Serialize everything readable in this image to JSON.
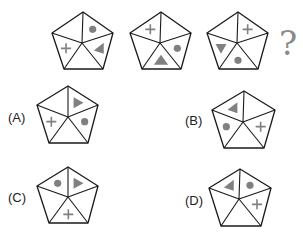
{
  "question_mark": "?",
  "colors": {
    "stroke": "#1a1a1a",
    "symbol": "#808080"
  },
  "sequence": [
    {
      "id": "seq-1",
      "top": [
        83,
        12
      ],
      "right": [
        113,
        33
      ],
      "br": [
        103,
        69
      ],
      "bl": [
        64,
        69
      ],
      "left": [
        52,
        33
      ],
      "center": [
        82,
        43
      ],
      "symbols": {
        "0": "dot",
        "1": "triangle-left",
        "3": "plus"
      }
    },
    {
      "id": "seq-2",
      "top": [
        161,
        12
      ],
      "right": [
        191,
        33
      ],
      "br": [
        181,
        69
      ],
      "bl": [
        142,
        69
      ],
      "left": [
        130,
        33
      ],
      "center": [
        160,
        43
      ],
      "symbols": {
        "1": "dot",
        "2": "triangle-up",
        "4": "plus"
      }
    },
    {
      "id": "seq-3",
      "top": [
        238,
        12
      ],
      "right": [
        268,
        33
      ],
      "br": [
        258,
        69
      ],
      "bl": [
        219,
        69
      ],
      "left": [
        207,
        33
      ],
      "center": [
        237,
        43
      ],
      "symbols": {
        "0": "plus",
        "2": "dot",
        "3": "triangle-down"
      }
    }
  ],
  "options": [
    {
      "label": "(A)",
      "label_pos": [
        8,
        110
      ],
      "top": [
        68,
        86
      ],
      "right": [
        98,
        105
      ],
      "br": [
        88,
        143
      ],
      "bl": [
        49,
        143
      ],
      "left": [
        37,
        105
      ],
      "center": [
        68,
        117
      ],
      "symbols": {
        "0": "triangle-right",
        "1": "dot",
        "3": "plus"
      }
    },
    {
      "label": "(B)",
      "label_pos": [
        185,
        113
      ],
      "top": [
        244,
        91
      ],
      "right": [
        275,
        110
      ],
      "br": [
        264,
        148
      ],
      "bl": [
        224,
        148
      ],
      "left": [
        212,
        110
      ],
      "center": [
        243,
        122
      ],
      "symbols": {
        "1": "plus",
        "3": "dot",
        "4": "triangle-left"
      }
    },
    {
      "label": "(C)",
      "label_pos": [
        8,
        190
      ],
      "top": [
        68,
        167
      ],
      "right": [
        98,
        186
      ],
      "br": [
        88,
        223
      ],
      "bl": [
        49,
        223
      ],
      "left": [
        37,
        186
      ],
      "center": [
        68,
        197
      ],
      "symbols": {
        "0": "triangle-right",
        "2": "plus",
        "4": "dot"
      }
    },
    {
      "label": "(D)",
      "label_pos": [
        185,
        193
      ],
      "top": [
        240,
        169
      ],
      "right": [
        271,
        188
      ],
      "br": [
        261,
        226
      ],
      "bl": [
        221,
        226
      ],
      "left": [
        209,
        188
      ],
      "center": [
        239,
        199
      ],
      "symbols": {
        "0": "dot",
        "1": "plus",
        "4": "triangle-left"
      }
    }
  ]
}
